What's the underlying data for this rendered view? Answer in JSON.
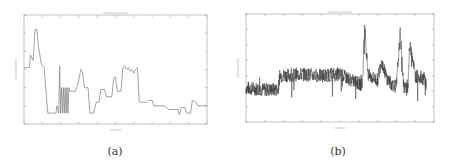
{
  "figure": {
    "captions": [
      "(a)",
      "(b)"
    ]
  },
  "chart_data": [
    {
      "type": "line",
      "panel": "(a)",
      "title": "",
      "xlabel": "",
      "ylabel": "",
      "grid": false,
      "x_ticks": 11,
      "y_ticks": 7,
      "line_color": "#8a8a8a",
      "x": [
        0,
        0.5,
        1,
        1.5,
        2,
        2.5,
        3,
        3.5,
        4,
        4.5,
        5,
        5.5,
        6,
        6.5,
        7,
        7.5,
        8,
        8.5,
        9,
        9.5,
        10
      ],
      "description": "Stepped series: starts ~3.1, peaks ~5.2 near x=0.6, drops to ~0.6 baseline around x=1.3-1.8, oscillating sawtooth ~0.6-2.0 near x=2, step to ~1.8, bump ~3 at x=3.1, dip ~0.6 at x=3.7, ~1.9 plateau near x=4.2, rise to ~3.2 at x=5.2, plateau ~3.1 at x=5.5-6.2, drop to ~1.2 at x=6.5, gradual decline ~1.0-0.4 to x=9, final ~1.2 at x=9.2 and ~1.0 at x=10",
      "series": [
        {
          "name": "signal-a",
          "points": [
            [
              0,
              3.1
            ],
            [
              0.3,
              3.1
            ],
            [
              0.35,
              3.8
            ],
            [
              0.5,
              3.5
            ],
            [
              0.6,
              5.2
            ],
            [
              0.7,
              5.2
            ],
            [
              0.8,
              4.2
            ],
            [
              0.95,
              3.3
            ],
            [
              1.1,
              3.1
            ],
            [
              1.3,
              0.6
            ],
            [
              1.6,
              0.6
            ],
            [
              1.75,
              0.6
            ],
            [
              1.8,
              1.0
            ],
            [
              1.9,
              0.6
            ],
            [
              1.95,
              3.2
            ],
            [
              2.0,
              0.6
            ],
            [
              2.05,
              2.0
            ],
            [
              2.1,
              0.6
            ],
            [
              2.15,
              2.0
            ],
            [
              2.2,
              0.6
            ],
            [
              2.25,
              2.0
            ],
            [
              2.3,
              0.6
            ],
            [
              2.35,
              2.0
            ],
            [
              2.4,
              0.6
            ],
            [
              2.45,
              2.0
            ],
            [
              2.5,
              1.8
            ],
            [
              2.8,
              1.8
            ],
            [
              2.95,
              2.2
            ],
            [
              3.1,
              3.0
            ],
            [
              3.2,
              2.9
            ],
            [
              3.3,
              2.0
            ],
            [
              3.5,
              2.0
            ],
            [
              3.6,
              0.6
            ],
            [
              3.8,
              0.6
            ],
            [
              3.95,
              1.2
            ],
            [
              4.1,
              1.2
            ],
            [
              4.2,
              1.9
            ],
            [
              4.4,
              1.9
            ],
            [
              4.5,
              1.5
            ],
            [
              4.8,
              1.5
            ],
            [
              4.9,
              2.5
            ],
            [
              5.0,
              2.6
            ],
            [
              5.1,
              1.8
            ],
            [
              5.3,
              1.8
            ],
            [
              5.4,
              3.1
            ],
            [
              5.5,
              3.2
            ],
            [
              5.6,
              3.0
            ],
            [
              5.7,
              3.1
            ],
            [
              5.8,
              2.9
            ],
            [
              5.9,
              3.0
            ],
            [
              6.0,
              2.8
            ],
            [
              6.1,
              3.0
            ],
            [
              6.2,
              3.1
            ],
            [
              6.3,
              1.2
            ],
            [
              6.7,
              1.2
            ],
            [
              6.8,
              1.3
            ],
            [
              7.0,
              1.3
            ],
            [
              7.1,
              1.0
            ],
            [
              7.3,
              1.0
            ],
            [
              7.5,
              1.0
            ],
            [
              7.7,
              1.0
            ],
            [
              7.9,
              0.8
            ],
            [
              8.2,
              0.8
            ],
            [
              8.4,
              0.8
            ],
            [
              8.5,
              0.5
            ],
            [
              8.6,
              0.9
            ],
            [
              8.8,
              0.9
            ],
            [
              8.9,
              0.6
            ],
            [
              9.0,
              0.6
            ],
            [
              9.1,
              0.6
            ],
            [
              9.2,
              1.3
            ],
            [
              9.4,
              1.2
            ],
            [
              9.5,
              1.0
            ],
            [
              10,
              1.0
            ]
          ]
        }
      ]
    },
    {
      "type": "line",
      "panel": "(b)",
      "title": "",
      "xlabel": "",
      "ylabel": "",
      "grid": false,
      "x_ticks": 11,
      "y_ticks": 8,
      "line_color": "#333333",
      "description": "Noisy dense time series: baseline ~2.1 for x 0-1.7, shifts to ~3.0 for x 1.7-5.3, dips to ~2.5 around x 5.5-6.2 with large spikes (to ~6.2 near x=6.3, ~5.8 near x=8.2, ~5.0 near x=7.8, ~4.8 near x=8.7), cluster ~2.2 around x 7.6-8.5, final segment ~3.0 from x 9-9.6",
      "series": [
        {
          "name": "signal-b",
          "summary_points": [
            [
              0,
              2.2
            ],
            [
              1.0,
              2.1
            ],
            [
              1.7,
              2.1
            ],
            [
              1.8,
              3.0
            ],
            [
              3.0,
              3.1
            ],
            [
              4.0,
              3.0
            ],
            [
              5.0,
              3.1
            ],
            [
              5.3,
              2.9
            ],
            [
              5.8,
              2.6
            ],
            [
              6.2,
              2.4
            ],
            [
              6.3,
              6.2
            ],
            [
              6.5,
              3.0
            ],
            [
              7.0,
              2.7
            ],
            [
              7.2,
              4.0
            ],
            [
              7.5,
              2.8
            ],
            [
              7.7,
              2.5
            ],
            [
              8.0,
              2.3
            ],
            [
              8.2,
              5.8
            ],
            [
              8.4,
              2.2
            ],
            [
              8.6,
              2.1
            ],
            [
              8.7,
              4.8
            ],
            [
              8.8,
              4.7
            ],
            [
              9.0,
              3.0
            ],
            [
              9.5,
              2.8
            ],
            [
              9.6,
              2.4
            ]
          ]
        }
      ]
    }
  ]
}
